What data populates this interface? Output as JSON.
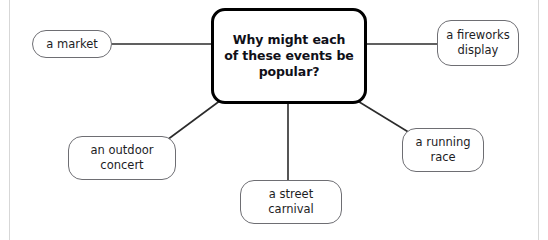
{
  "diagram": {
    "type": "mind-map",
    "title": "Why might each of these events be popular?",
    "central": {
      "id": "central-question",
      "text": "Why might each of these events be popular?",
      "lines": [
        "Why might each",
        "of these events be",
        "popular?"
      ],
      "border_color": "#000000",
      "text_color": "#101018"
    },
    "branches": [
      {
        "id": "market",
        "text": "a market",
        "lines": [
          "a market"
        ],
        "position": "left",
        "border_color": "#6e6e73"
      },
      {
        "id": "fireworks",
        "text": "a fireworks display",
        "lines": [
          "a fireworks",
          "display"
        ],
        "position": "top-right",
        "border_color": "#6e6e73"
      },
      {
        "id": "outdoor-concert",
        "text": "an outdoor concert",
        "lines": [
          "an outdoor",
          "concert"
        ],
        "position": "bottom-left",
        "border_color": "#6e6e73"
      },
      {
        "id": "street-carnival",
        "text": "a street carnival",
        "lines": [
          "a street",
          "carnival"
        ],
        "position": "bottom-center",
        "border_color": "#6e6e73"
      },
      {
        "id": "running-race",
        "text": "a running race",
        "lines": [
          "a running",
          "race"
        ],
        "position": "bottom-right",
        "border_color": "#6e6e73"
      }
    ],
    "connectors": [
      {
        "from": "central-question",
        "to": "market",
        "style": "straight"
      },
      {
        "from": "central-question",
        "to": "fireworks",
        "style": "straight"
      },
      {
        "from": "central-question",
        "to": "outdoor-concert",
        "style": "straight"
      },
      {
        "from": "central-question",
        "to": "street-carnival",
        "style": "straight"
      },
      {
        "from": "central-question",
        "to": "running-race",
        "style": "straight"
      }
    ],
    "background_color": "#ffffff",
    "rule_color": "#d7d7d7"
  }
}
